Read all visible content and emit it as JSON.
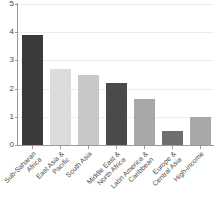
{
  "chart_data": {
    "type": "bar",
    "title": "",
    "subtitle": "",
    "xlabel": "",
    "ylabel": "",
    "ylim": [
      0,
      5
    ],
    "yticks": [
      0,
      1,
      2,
      3,
      4,
      5
    ],
    "ytick_labels": [
      "0",
      "1",
      "2",
      "3",
      "4",
      "5"
    ],
    "grid": true,
    "grid_axis": "y",
    "legend": false,
    "legend_position": "none",
    "categories": [
      "Sub-Saharan Africa",
      "East Asia & Pacific",
      "South Asia",
      "Middle East & North Africa",
      "Latin America & Caribbean",
      "Europe & Central Asia",
      "High-income"
    ],
    "category_lines": [
      [
        "Sub-Saharan",
        "Africa"
      ],
      [
        "East Asia &",
        "Pacific"
      ],
      [
        "South Asia",
        ""
      ],
      [
        "Middle East &",
        "North Africa"
      ],
      [
        "Latin America &",
        "Caribbean"
      ],
      [
        "Europe &",
        "Central Asia"
      ],
      [
        "High-income",
        ""
      ]
    ],
    "values": [
      3.9,
      2.68,
      2.48,
      2.2,
      1.62,
      0.5,
      1.0
    ],
    "bar_colors": [
      "#3a3a3a",
      "#dcdcdc",
      "#c8c8c8",
      "#4a4a4a",
      "#a8a8a8",
      "#6e6e6e",
      "#a8a8a8"
    ],
    "axis_color": "#9a9a9a",
    "grid_color": "#ededed",
    "text_color": "#4a4a4a",
    "background": "#ffffff"
  }
}
